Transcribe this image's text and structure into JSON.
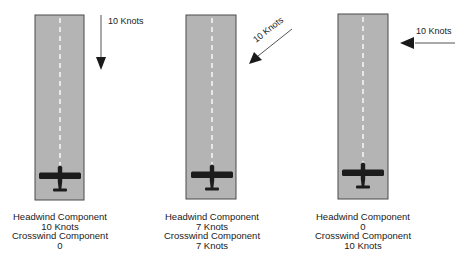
{
  "colors": {
    "runway_fill": "#b4b4b4",
    "runway_border": "#4a4a4a",
    "centerline": "#f4f4f4",
    "airplane": "#1c1c1c",
    "arrow": "#1a1a1a",
    "text": "#1a1a1a"
  },
  "panels": [
    {
      "id": "headwind",
      "wind_label": "10 Knots",
      "wind_direction": "down (from ahead, parallel to runway)",
      "headwind_title": "Headwind Component",
      "headwind_value": "10 Knots",
      "crosswind_title": "Crosswind Component",
      "crosswind_value": "0"
    },
    {
      "id": "diagonal",
      "wind_label": "10 Knots",
      "wind_direction": "down-left (45 degrees)",
      "headwind_title": "Headwind Component",
      "headwind_value": "7 Knots",
      "crosswind_title": "Crosswind Component",
      "crosswind_value": "7 Knots"
    },
    {
      "id": "crosswind",
      "wind_label": "10 Knots",
      "wind_direction": "left (perpendicular to runway)",
      "headwind_title": "Headwind Component",
      "headwind_value": "0",
      "crosswind_title": "Crosswind Component",
      "crosswind_value": "10 Knots"
    }
  ]
}
